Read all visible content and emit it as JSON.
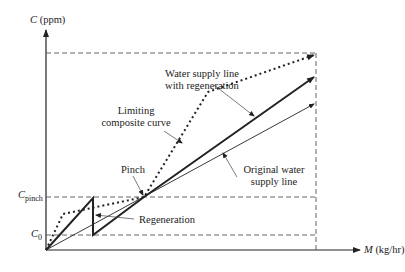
{
  "diagram": {
    "y_axis": {
      "symbol": "C",
      "unit": "(ppm)"
    },
    "x_axis": {
      "symbol": "M",
      "unit": "(kg/hr)"
    },
    "y_ticks": [
      {
        "symbol": "C",
        "subscript": "pinch"
      },
      {
        "symbol": "C",
        "subscript": "0"
      }
    ],
    "labels": {
      "water_supply_regen_1": "Water supply line",
      "water_supply_regen_2": "with regeneration",
      "limiting_1": "Limiting",
      "limiting_2": "composite curve",
      "pinch": "Pinch",
      "original_1": "Original water",
      "original_2": "supply line",
      "regeneration": "Regeneration"
    },
    "colors": {
      "ink": "#222222",
      "dash": "#555555"
    }
  }
}
